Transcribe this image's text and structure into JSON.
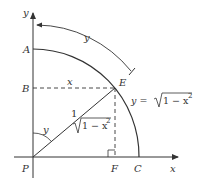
{
  "diagram": {
    "type": "unit-circle-arc-geometry",
    "colors": {
      "stroke": "#333333",
      "background": "#ffffff"
    },
    "axes": {
      "x_label": "x",
      "y_label": "y"
    },
    "points": {
      "A": "A",
      "B": "B",
      "C": "C",
      "E": "E",
      "F": "F",
      "P": "P"
    },
    "labels": {
      "arc_length": "y",
      "segment_BE": "x",
      "radius_PE": "1",
      "angle_at_P": "y",
      "segment_PF": "√1 − x²",
      "sqrt_symbol": "√",
      "sqrt_radicand": "1 − x",
      "sqrt_exponent": "2",
      "curve_equation_lhs": "y = ",
      "curve_equation_radicand": "1 − x",
      "curve_equation_exponent": "2"
    }
  }
}
